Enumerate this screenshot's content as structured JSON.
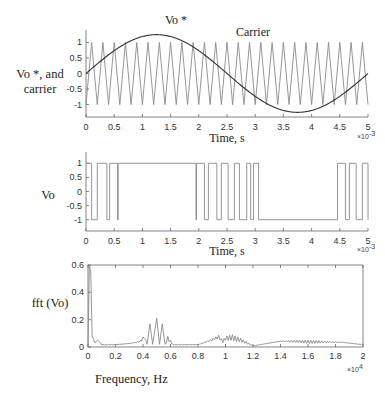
{
  "chart_data": [
    {
      "type": "line",
      "ylabel_line1": "Vo *, and",
      "ylabel_line2": "carrier",
      "xlabel": "Time, s",
      "x_exponent": "×10",
      "x_exponent_power": "-3",
      "xlim": [
        0,
        5
      ],
      "ylim": [
        -1.4,
        1.4
      ],
      "xticks": [
        "0",
        "0.5",
        "1",
        "1.5",
        "2",
        "2.5",
        "3",
        "3.5",
        "4",
        "4.5",
        "5"
      ],
      "yticks": [
        "1",
        "0.5",
        "0",
        "-0.5",
        "-1"
      ],
      "annotations": [
        "Vo *",
        "Carrier"
      ],
      "series": [
        {
          "name": "Vo *",
          "kind": "sine",
          "amplitude": 1.25,
          "frequency_hz": 200,
          "color": "#333333"
        },
        {
          "name": "Carrier",
          "kind": "triangle",
          "amplitude": 1.0,
          "cycles": 25,
          "color": "#888888"
        }
      ],
      "grid": false
    },
    {
      "type": "line",
      "ylabel": "Vo",
      "xlabel": "Time, s",
      "x_exponent": "×10",
      "x_exponent_power": "-3",
      "xlim": [
        0,
        5
      ],
      "ylim": [
        -1.4,
        1.4
      ],
      "xticks": [
        "0",
        "0.5",
        "1",
        "1.5",
        "2",
        "2.5",
        "3",
        "3.5",
        "4",
        "4.5",
        "5"
      ],
      "yticks": [
        "1",
        "0.5",
        "0",
        "-0.5",
        "-1"
      ],
      "series": [
        {
          "name": "Vo",
          "kind": "pwm",
          "color": "#888888",
          "low_intervals_ms": [
            [
              0.1,
              0.2
            ],
            [
              0.37,
              0.42
            ],
            [
              0.56,
              0.57
            ],
            [
              1.95,
              1.96
            ],
            [
              2.1,
              2.17
            ],
            [
              2.32,
              2.4
            ],
            [
              2.52,
              2.63
            ],
            [
              2.72,
              2.85
            ],
            [
              2.92,
              2.97
            ],
            [
              3.06,
              4.46
            ],
            [
              4.6,
              4.67
            ],
            [
              4.79,
              4.9
            ]
          ]
        }
      ],
      "grid": false
    },
    {
      "type": "line",
      "ylabel": "fft (Vo)",
      "xlabel": "Frequency, Hz",
      "x_exponent": "×10",
      "x_exponent_power": "4",
      "xlim": [
        0,
        2
      ],
      "ylim": [
        0,
        0.6
      ],
      "xticks": [
        "0",
        "0.2",
        "0.4",
        "0.6",
        "0.8",
        "1",
        "1.2",
        "1.4",
        "1.6",
        "1.8",
        "2"
      ],
      "yticks": [
        "0.6",
        "0.4",
        "0.2",
        "0"
      ],
      "series": [
        {
          "name": "fft (Vo)",
          "color": "#888888",
          "x": [
            0,
            0.01,
            0.02,
            0.03,
            0.05,
            0.07,
            0.1,
            0.2,
            0.3,
            0.35,
            0.38,
            0.41,
            0.43,
            0.45,
            0.47,
            0.5,
            0.52,
            0.54,
            0.56,
            0.58,
            0.62,
            0.8,
            0.9,
            0.95,
            0.98,
            1.0,
            1.05,
            1.1,
            1.2,
            1.4,
            1.6,
            1.85,
            2.0
          ],
          "y": [
            0,
            0.6,
            0.55,
            0.08,
            0.03,
            0.05,
            0.02,
            0.02,
            0.03,
            0.04,
            0.05,
            0.09,
            0.02,
            0.17,
            0.02,
            0.21,
            0.02,
            0.17,
            0.02,
            0.08,
            0.02,
            0.02,
            0.06,
            0.09,
            0.05,
            0.08,
            0.09,
            0.07,
            0.01,
            0.05,
            0.05,
            0.04,
            0.02
          ]
        }
      ],
      "grid": false
    }
  ]
}
